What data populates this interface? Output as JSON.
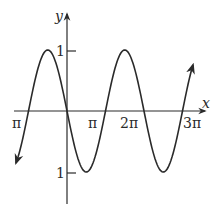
{
  "chart_data": {
    "type": "line",
    "title": "",
    "xlabel": "x",
    "ylabel": "y",
    "function": "y = -sin(x) (periodic sine-like wave)",
    "x_tick_labels": [
      "π",
      "π",
      "2π",
      "3π"
    ],
    "y_tick_labels": [
      "1",
      "1"
    ],
    "ylim": [
      -1,
      1
    ],
    "grid": false,
    "legend": null,
    "series": [
      {
        "name": "curve",
        "x": [
          -1.0,
          -0.5,
          0,
          0.5,
          1.0,
          1.5,
          2.0,
          2.5,
          3.0
        ],
        "values": [
          0,
          1,
          0,
          -1,
          0,
          1,
          0,
          -1,
          0
        ]
      }
    ],
    "line_color": "#2a2a2a"
  },
  "labels": {
    "x_axis": "x",
    "y_axis": "y",
    "x_ticks": [
      "π",
      "π",
      "2π",
      "3π"
    ],
    "y_top": "1",
    "y_bottom": "1"
  }
}
